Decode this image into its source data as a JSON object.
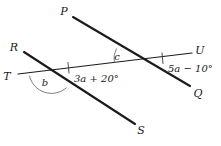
{
  "figure": {
    "type": "geometry-diagram",
    "background_color": "#ffffff",
    "line_color": "#1b1b1b",
    "arc_color": "#6f6f6f"
  },
  "points": [
    {
      "id": "P",
      "label": "P",
      "x": 64,
      "y": 11
    },
    {
      "id": "R",
      "label": "R",
      "x": 14,
      "y": 47
    },
    {
      "id": "T",
      "label": "T",
      "x": 7,
      "y": 76
    },
    {
      "id": "U",
      "label": "U",
      "x": 198,
      "y": 50
    },
    {
      "id": "Q",
      "label": "Q",
      "x": 196,
      "y": 93
    },
    {
      "id": "S",
      "label": "S",
      "x": 140,
      "y": 130
    }
  ],
  "lines": [
    {
      "id": "PQ",
      "from": "P",
      "to": "Q",
      "weight": "thick"
    },
    {
      "id": "RS",
      "from": "R",
      "to": "S",
      "weight": "thick"
    },
    {
      "id": "TU",
      "from": "T",
      "to": "U",
      "weight": "thin"
    }
  ],
  "intersections": [
    {
      "id": "left",
      "lines": "RS-TU",
      "x": 52,
      "y": 73
    },
    {
      "id": "right",
      "lines": "PQ-TU",
      "x": 136,
      "y": 60
    }
  ],
  "angles": [
    {
      "id": "c",
      "label": "c",
      "kind": "variable",
      "x": 117,
      "y": 57
    },
    {
      "id": "b",
      "label": "b",
      "kind": "variable",
      "x": 45,
      "y": 83
    },
    {
      "id": "a1",
      "label": "3a + 20°",
      "kind": "expression",
      "x": 73,
      "y": 80
    },
    {
      "id": "a2",
      "label": "5a − 10°",
      "kind": "expression",
      "x": 167,
      "y": 70
    }
  ],
  "tick_marks": [
    {
      "id": "tick-left",
      "on": "TU",
      "x": 68,
      "y": 68
    },
    {
      "id": "tick-right",
      "on": "TU",
      "x": 162,
      "y": 58
    }
  ]
}
